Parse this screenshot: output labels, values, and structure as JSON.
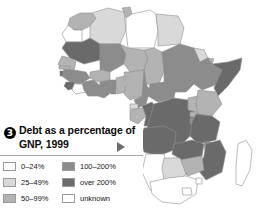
{
  "figure": {
    "number": "3",
    "title": "Debt as a percentage of GNP, 1999",
    "marker_icon": "play-triangle-icon",
    "background": "#ffffff"
  },
  "legend": {
    "entries": [
      {
        "label": "0–24%",
        "color": "#ffffff",
        "column": "left"
      },
      {
        "label": "25–49%",
        "color": "#d9d9d9",
        "column": "left"
      },
      {
        "label": "50–99%",
        "color": "#b3b3b3",
        "column": "left"
      },
      {
        "label": "100–200%",
        "color": "#8c8c8c",
        "column": "right"
      },
      {
        "label": "over 200%",
        "color": "#6b6b6b",
        "column": "right"
      },
      {
        "label": "unknown",
        "color": "#ffffff",
        "column": "right"
      }
    ]
  },
  "map": {
    "title": "Africa",
    "projection": "choropleth",
    "outline_color": "#8f8f8f",
    "regions": [
      {
        "name": "Morocco",
        "class": "50-99%",
        "color": "#b3b3b3"
      },
      {
        "name": "Western Sahara",
        "class": "unknown",
        "color": "#ffffff"
      },
      {
        "name": "Algeria",
        "class": "25-49%",
        "color": "#d9d9d9"
      },
      {
        "name": "Tunisia",
        "class": "50-99%",
        "color": "#b3b3b3"
      },
      {
        "name": "Libya",
        "class": "unknown",
        "color": "#ffffff"
      },
      {
        "name": "Egypt",
        "class": "25-49%",
        "color": "#d9d9d9"
      },
      {
        "name": "Mauritania",
        "class": "over 200%",
        "color": "#6b6b6b"
      },
      {
        "name": "Mali",
        "class": "100-200%",
        "color": "#8c8c8c"
      },
      {
        "name": "Niger",
        "class": "50-99%",
        "color": "#b3b3b3"
      },
      {
        "name": "Chad",
        "class": "50-99%",
        "color": "#b3b3b3"
      },
      {
        "name": "Sudan",
        "class": "100-200%",
        "color": "#8c8c8c"
      },
      {
        "name": "Eritrea",
        "class": "25-49%",
        "color": "#d9d9d9"
      },
      {
        "name": "Djibouti",
        "class": "50-99%",
        "color": "#b3b3b3"
      },
      {
        "name": "Ethiopia",
        "class": "100-200%",
        "color": "#8c8c8c"
      },
      {
        "name": "Somalia",
        "class": "over 200%",
        "color": "#6b6b6b"
      },
      {
        "name": "Senegal",
        "class": "50-99%",
        "color": "#b3b3b3"
      },
      {
        "name": "Gambia",
        "class": "50-99%",
        "color": "#b3b3b3"
      },
      {
        "name": "Guinea-Bissau",
        "class": "over 200%",
        "color": "#6b6b6b"
      },
      {
        "name": "Guinea",
        "class": "100-200%",
        "color": "#8c8c8c"
      },
      {
        "name": "Sierra Leone",
        "class": "over 200%",
        "color": "#6b6b6b"
      },
      {
        "name": "Liberia",
        "class": "unknown",
        "color": "#ffffff"
      },
      {
        "name": "Cote d'Ivoire",
        "class": "100-200%",
        "color": "#8c8c8c"
      },
      {
        "name": "Burkina Faso",
        "class": "50-99%",
        "color": "#b3b3b3"
      },
      {
        "name": "Ghana",
        "class": "100-200%",
        "color": "#8c8c8c"
      },
      {
        "name": "Togo",
        "class": "100-200%",
        "color": "#8c8c8c"
      },
      {
        "name": "Benin",
        "class": "50-99%",
        "color": "#b3b3b3"
      },
      {
        "name": "Nigeria",
        "class": "50-99%",
        "color": "#b3b3b3"
      },
      {
        "name": "Cameroon",
        "class": "100-200%",
        "color": "#8c8c8c"
      },
      {
        "name": "Central African Republic",
        "class": "100-200%",
        "color": "#8c8c8c"
      },
      {
        "name": "Equatorial Guinea",
        "class": "25-49%",
        "color": "#d9d9d9"
      },
      {
        "name": "Gabon",
        "class": "50-99%",
        "color": "#b3b3b3"
      },
      {
        "name": "Congo",
        "class": "over 200%",
        "color": "#6b6b6b"
      },
      {
        "name": "Dem. Rep. of the Congo",
        "class": "over 200%",
        "color": "#6b6b6b"
      },
      {
        "name": "Uganda",
        "class": "50-99%",
        "color": "#b3b3b3"
      },
      {
        "name": "Kenya",
        "class": "50-99%",
        "color": "#b3b3b3"
      },
      {
        "name": "Rwanda",
        "class": "50-99%",
        "color": "#b3b3b3"
      },
      {
        "name": "Burundi",
        "class": "100-200%",
        "color": "#8c8c8c"
      },
      {
        "name": "Tanzania",
        "class": "over 200%",
        "color": "#6b6b6b"
      },
      {
        "name": "Angola",
        "class": "over 200%",
        "color": "#6b6b6b"
      },
      {
        "name": "Zambia",
        "class": "over 200%",
        "color": "#6b6b6b"
      },
      {
        "name": "Malawi",
        "class": "100-200%",
        "color": "#8c8c8c"
      },
      {
        "name": "Mozambique",
        "class": "over 200%",
        "color": "#6b6b6b"
      },
      {
        "name": "Zimbabwe",
        "class": "50-99%",
        "color": "#b3b3b3"
      },
      {
        "name": "Namibia",
        "class": "0-24%",
        "color": "#ffffff"
      },
      {
        "name": "Botswana",
        "class": "25-49%",
        "color": "#d9d9d9"
      },
      {
        "name": "South Africa",
        "class": "0-24%",
        "color": "#ffffff"
      },
      {
        "name": "Lesotho",
        "class": "0-24%",
        "color": "#ffffff"
      },
      {
        "name": "Swaziland",
        "class": "0-24%",
        "color": "#ffffff"
      },
      {
        "name": "Madagascar",
        "class": "unknown",
        "color": "#ffffff"
      }
    ]
  }
}
